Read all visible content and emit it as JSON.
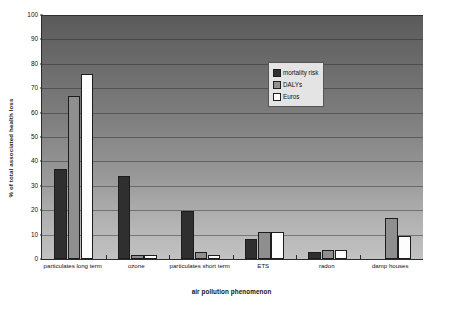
{
  "chart_data": {
    "type": "bar",
    "title": "",
    "xlabel": "air pollution phenomenon",
    "ylabel": "% of total associated health loss",
    "ylim": [
      0,
      100
    ],
    "ytick_step": 10,
    "yticks": [
      0,
      10,
      20,
      30,
      40,
      50,
      60,
      70,
      80,
      90,
      100
    ],
    "grid": true,
    "legend_position": "top-right-inside",
    "categories": [
      "particulates long term",
      "ozone",
      "particulates short term",
      "ETS",
      "radon",
      "damp houses"
    ],
    "series": [
      {
        "name": "mortality risk",
        "color": "#2f2f2f",
        "values": [
          37,
          34,
          19.5,
          8,
          3,
          0
        ]
      },
      {
        "name": "DALYs",
        "color": "#8f8f8f",
        "values": [
          67,
          1.5,
          3,
          11,
          3.5,
          17
        ]
      },
      {
        "name": "Euros",
        "color": "#fdfdfd",
        "values": [
          76,
          1.5,
          1.5,
          11,
          3.5,
          9.5
        ]
      }
    ]
  },
  "legend": {
    "items": [
      {
        "label": "mortality risk"
      },
      {
        "label": "DALYs"
      },
      {
        "label": "Euros"
      }
    ]
  },
  "axes": {
    "y_title": "% of total associated health loss",
    "x_title": "air pollution phenomenon",
    "y_tick_labels": [
      "100",
      "90",
      "80",
      "70",
      "60",
      "50",
      "40",
      "30",
      "20",
      "10",
      "0"
    ]
  },
  "colors": {
    "series_mortality": "#2f2f2f",
    "series_dalys": "#8f8f8f",
    "series_euros": "#fdfdfd",
    "plot_bg_top": "#5a5a5a",
    "plot_bg_bottom": "#c2c2c2",
    "axis": "#2b2b2b"
  }
}
